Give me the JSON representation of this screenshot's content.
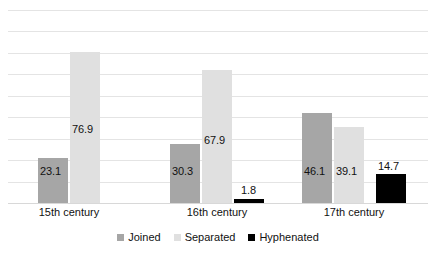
{
  "chart_data": {
    "type": "bar",
    "title": "",
    "subtitle": "",
    "xlabel": "",
    "ylabel": "",
    "ylim": [
      0,
      90
    ],
    "grid": true,
    "gridlines": [
      0,
      10,
      20,
      30,
      40,
      50,
      60,
      70,
      80,
      90
    ],
    "legend_position": "bottom",
    "categories": [
      "15th century",
      "16th century",
      "17th century"
    ],
    "series": [
      {
        "name": "Joined",
        "color": "#a6a6a6",
        "values": [
          23.1,
          30.3,
          46.1
        ],
        "labels": [
          "23.1",
          "30.3",
          "46.1"
        ]
      },
      {
        "name": "Separated",
        "color": "#e0e0e0",
        "values": [
          76.9,
          67.9,
          39.1
        ],
        "labels": [
          "76.9",
          "67.9",
          "39.1"
        ]
      },
      {
        "name": "Hyphenated",
        "color": "#000000",
        "values": [
          0,
          1.8,
          14.7
        ],
        "labels": [
          "",
          "1.8",
          "14.7"
        ]
      }
    ]
  },
  "legend": {
    "items": [
      {
        "label": "Joined",
        "swatch": "joined"
      },
      {
        "label": "Separated",
        "swatch": "separated"
      },
      {
        "label": "Hyphenated",
        "swatch": "hyphenated"
      }
    ]
  },
  "axis": {
    "categories": [
      {
        "label": "15th century"
      },
      {
        "label": "16th century"
      },
      {
        "label": "17th century"
      }
    ]
  },
  "bars": [
    {
      "series": "Joined",
      "category": "15th century",
      "value": 23.1,
      "label": "23.1"
    },
    {
      "series": "Separated",
      "category": "15th century",
      "value": 76.9,
      "label": "76.9"
    },
    {
      "series": "Joined",
      "category": "16th century",
      "value": 30.3,
      "label": "30.3"
    },
    {
      "series": "Separated",
      "category": "16th century",
      "value": 67.9,
      "label": "67.9"
    },
    {
      "series": "Hyphenated",
      "category": "16th century",
      "value": 1.8,
      "label": "1.8"
    },
    {
      "series": "Joined",
      "category": "17th century",
      "value": 46.1,
      "label": "46.1"
    },
    {
      "series": "Separated",
      "category": "17th century",
      "value": 39.1,
      "label": "39.1"
    },
    {
      "series": "Hyphenated",
      "category": "17th century",
      "value": 14.7,
      "label": "14.7"
    }
  ],
  "colors": {
    "joined": "#a6a6a6",
    "separated": "#e0e0e0",
    "hyphenated": "#000000",
    "gridline": "#e4e4e4",
    "background": "#ffffff",
    "text": "#111111"
  }
}
